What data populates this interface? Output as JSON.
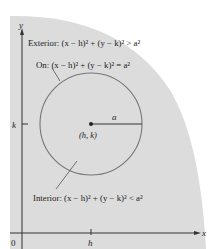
{
  "figure": {
    "colors": {
      "background": "#ffffff",
      "shaded_region": "#dcdcdc",
      "circle_interior": "#dcdcdc",
      "stroke": "#555555",
      "axis": "#333333",
      "text": "#222222"
    },
    "axes": {
      "x_label": "x",
      "y_label": "y",
      "origin_label": "0",
      "x_tick_label": "h",
      "y_tick_label": "k"
    },
    "circle": {
      "center_label": "(h, k)",
      "radius_label": "a"
    },
    "annotations": {
      "exterior": "Exterior: (x − h)² + (y − k)² > a²",
      "on": "On: (x − h)² + (y − k)² = a²",
      "interior": "Interior: (x − h)² + (y − k)² < a²"
    }
  }
}
